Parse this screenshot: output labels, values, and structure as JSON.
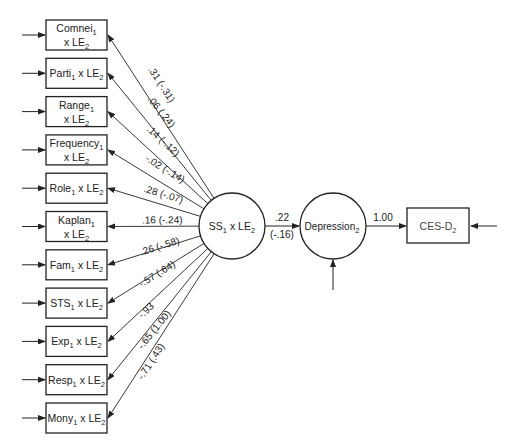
{
  "diagram": {
    "type": "path-diagram",
    "indicators": [
      {
        "name": "Comnei",
        "sub": "1",
        "suffix": "x LE",
        "suffix_sub": "2",
        "two_line": true,
        "coef": ".31 (-.31)"
      },
      {
        "name": "Parti",
        "sub": "1",
        "suffix": "x LE",
        "suffix_sub": "2",
        "two_line": false,
        "coef": ".06 (.24)"
      },
      {
        "name": "Range",
        "sub": "1",
        "suffix": "x LE",
        "suffix_sub": "2",
        "two_line": true,
        "coef": ".14 (-.12)"
      },
      {
        "name": "Frequency",
        "sub": "1",
        "suffix": "x LE",
        "suffix_sub": "2",
        "two_line": true,
        "coef": "-.02 (-.14)"
      },
      {
        "name": "Role",
        "sub": "1",
        "suffix": "x LE",
        "suffix_sub": "2",
        "two_line": false,
        "coef": ".28 (-.07)"
      },
      {
        "name": "Kaplan",
        "sub": "1",
        "suffix": "x LE",
        "suffix_sub": "2",
        "two_line": true,
        "coef": ".16 (-.24)"
      },
      {
        "name": "Fam",
        "sub": "1",
        "suffix": "x LE",
        "suffix_sub": "2",
        "two_line": false,
        "coef": ".26 (-.58)"
      },
      {
        "name": "STS",
        "sub": "1",
        "suffix": "x LE",
        "suffix_sub": "2",
        "two_line": false,
        "coef": "-.57 (.64)"
      },
      {
        "name": "Exp",
        "sub": "1",
        "suffix": "x LE",
        "suffix_sub": "2",
        "two_line": false,
        "coef": "-.93"
      },
      {
        "name": "Resp",
        "sub": "1",
        "suffix": "x LE",
        "suffix_sub": "2",
        "two_line": false,
        "coef": "-.65 (1.00)"
      },
      {
        "name": "Mony",
        "sub": "1",
        "suffix": "x LE",
        "suffix_sub": "2",
        "two_line": false,
        "coef": "-.71 (.43)"
      }
    ],
    "latent_interaction": {
      "label": "SS",
      "sub": "1",
      "suffix": "x LE",
      "suffix_sub": "2"
    },
    "latent_outcome": {
      "label": "Depression",
      "sub": "2"
    },
    "observed_outcome": {
      "label": "CES-D",
      "sub": "2"
    },
    "path_ss_to_depression": {
      "coef": ".22",
      "coef_alt": "(-.16)"
    },
    "path_depression_to_cesd": {
      "coef": "1.00"
    }
  }
}
